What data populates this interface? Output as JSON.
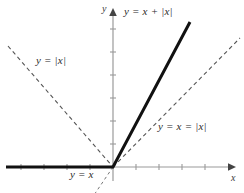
{
  "figure": {
    "type": "math-graph",
    "width": 244,
    "height": 193,
    "background": "#ffffff"
  },
  "axes": {
    "x_label": "x",
    "y_label": "y",
    "origin": {
      "x": 113,
      "y": 167
    },
    "x_axis": {
      "start_x": 6,
      "end_x": 232,
      "y": 167,
      "color": "#9a9a9a",
      "arrow": "right"
    },
    "y_axis": {
      "x": 113,
      "start_y": 181,
      "end_y": 11,
      "color": "#9a9a9a",
      "arrow": "up"
    },
    "tick_spacing": 23,
    "tick_length": 5,
    "x_ticks": [
      21,
      44,
      67,
      90,
      136,
      159,
      182,
      205
    ],
    "y_ticks": [
      144,
      121,
      98,
      75,
      52,
      29
    ]
  },
  "curves": [
    {
      "name": "y-eq-x-plus-abs-x",
      "label": "y = x + |x|",
      "style": "solid",
      "color": "#111111",
      "width": 3,
      "description": "thick black piecewise line: horizontal ray along negative x-axis, then slope 2 ray up-right",
      "segments": [
        {
          "x1": 6,
          "y1": 167,
          "x2": 113,
          "y2": 167
        },
        {
          "x1": 113,
          "y1": 167,
          "x2": 190,
          "y2": 22
        }
      ]
    },
    {
      "name": "y-eq-abs-x-left-branch",
      "label": "y = |x|",
      "style": "dashed",
      "color": "#555555",
      "width": 1,
      "description": "dashed V left branch descending from upper-left to origin",
      "segments": [
        {
          "x1": 8,
          "y1": 46,
          "x2": 113,
          "y2": 167
        }
      ]
    },
    {
      "name": "y-eq-x-equals-abs-x-right-branch",
      "label": "y = x = |x|",
      "style": "dashed",
      "color": "#555555",
      "width": 1,
      "description": "dashed diagonal rising from origin to upper-right; coincides with y = x and y = |x| for x > 0",
      "segments": [
        {
          "x1": 113,
          "y1": 167,
          "x2": 238,
          "y2": 40
        }
      ]
    },
    {
      "name": "y-eq-x-lower-branch",
      "label": "y = x",
      "style": "dashed",
      "color": "#777777",
      "width": 1,
      "description": "dashed continuation of y = x below the origin into the third quadrant",
      "segments": [
        {
          "x1": 113,
          "y1": 167,
          "x2": 96,
          "y2": 193
        }
      ]
    }
  ],
  "labels": {
    "main": "y = x + |x|",
    "abs_x": "y = |x|",
    "x_eq_abs_x": "y = x = |x|",
    "y_eq_x": "y = x",
    "x_axis": "x",
    "y_axis": "y"
  },
  "colors": {
    "curve_solid": "#111111",
    "curve_dashed": "#555555",
    "axis": "#9a9a9a",
    "text": "#2b2b2b",
    "background": "#ffffff"
  }
}
